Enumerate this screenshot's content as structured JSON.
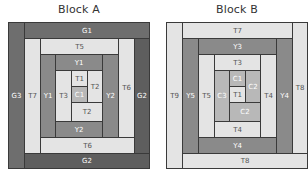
{
  "blocks": {
    "a": {
      "title": "Block A",
      "pieces": {
        "g3": "G3",
        "g1": "G1",
        "g2_right": "G2",
        "g2_bottom": "G2",
        "t7": "T7",
        "t5": "T5",
        "t6_right": "T6",
        "t6_bottom": "T6",
        "y1_left": "Y1",
        "y1_top": "Y1",
        "y2_right": "Y2",
        "y2_bottom": "Y2",
        "t3": "T3",
        "t1": "T1",
        "c1": "C1",
        "t2_right": "T2",
        "t2_bottom": "T2"
      }
    },
    "b": {
      "title": "Block B",
      "pieces": {
        "t9": "T9",
        "t7": "T7",
        "t8_right": "T8",
        "t8_bottom": "T8",
        "y5": "Y5",
        "y3": "Y3",
        "y4_right": "Y4",
        "y4_bottom": "Y4",
        "t5": "T5",
        "t3": "T3",
        "t4_right": "T4",
        "t4_bottom": "T4",
        "c3": "C3",
        "c1": "C1",
        "t1": "T1",
        "c2_right": "C2",
        "c2_bottom": "C2"
      }
    }
  },
  "colors": {
    "dark_gray": "#6e6e6e",
    "darker_gray": "#5e5e5e",
    "medium_gray": "#8a8a8a",
    "light_gray": "#e4e4e4",
    "mid_light_gray": "#b8b8b8",
    "outline": "#3a3a3a"
  }
}
